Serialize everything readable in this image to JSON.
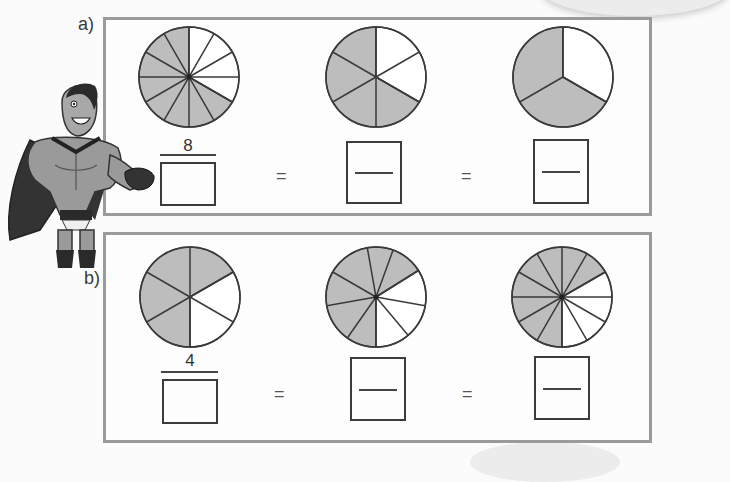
{
  "exercise": {
    "parts": [
      {
        "label": "a)",
        "given_numerator": "8",
        "equals_sign": "=",
        "pies": [
          {
            "sectors": 12,
            "shaded": 8,
            "fraction": "8/12"
          },
          {
            "sectors": 6,
            "shaded": 4,
            "fraction": "4/6"
          },
          {
            "sectors": 3,
            "shaded": 2,
            "fraction": "2/3"
          }
        ]
      },
      {
        "label": "b)",
        "given_numerator": "4",
        "equals_sign": "=",
        "pies": [
          {
            "sectors": 6,
            "shaded": 4,
            "fraction": "4/6"
          },
          {
            "sectors": 9,
            "shaded": 6,
            "fraction": "6/9"
          },
          {
            "sectors": 12,
            "shaded": 8,
            "fraction": "8/12"
          }
        ]
      }
    ]
  },
  "colors": {
    "shaded": "#bdbdbd",
    "unshaded": "#ffffff",
    "stroke": "#3a3a3a",
    "panel_border": "#9a9a9a"
  },
  "illustration": {
    "character": "superhero-pointing"
  }
}
